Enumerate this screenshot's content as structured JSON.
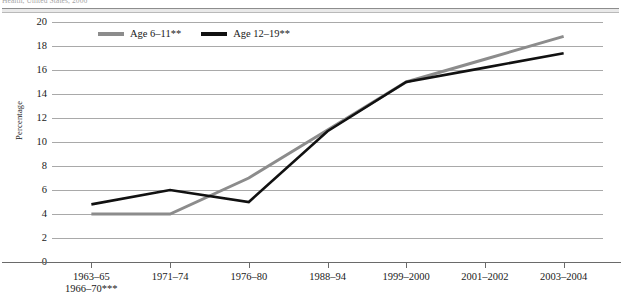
{
  "top_caption": "Health, United States, 2006",
  "chart_data": {
    "type": "line",
    "title": "",
    "xlabel": "",
    "ylabel": "Percentage",
    "ylim": [
      0,
      20
    ],
    "ytick_step": 2,
    "yticks": [
      "0",
      "2",
      "4",
      "6",
      "8",
      "10",
      "12",
      "14",
      "16",
      "18",
      "20"
    ],
    "grid": true,
    "legend_position": "top-left-inside",
    "categories": [
      "1963–65\n1966–70***",
      "1971–74",
      "1976–80",
      "1988–94",
      "1999–2000",
      "2001–2002",
      "2003–2004"
    ],
    "category_lines": [
      [
        "1963–65",
        "1966–70***"
      ],
      [
        "1971–74",
        ""
      ],
      [
        "1976–80",
        ""
      ],
      [
        "1988–94",
        ""
      ],
      [
        "1999–2000",
        ""
      ],
      [
        "2001–2002",
        ""
      ],
      [
        "2003–2004",
        ""
      ]
    ],
    "series": [
      {
        "name": "Age 6–11**",
        "color": "#8c8c8c",
        "values": [
          4.0,
          4.0,
          7.0,
          11.0,
          15.0,
          16.9,
          18.8
        ]
      },
      {
        "name": "Age 12–19**",
        "color": "#111111",
        "values": [
          4.8,
          6.0,
          5.0,
          10.9,
          15.0,
          16.2,
          17.4
        ]
      }
    ]
  }
}
